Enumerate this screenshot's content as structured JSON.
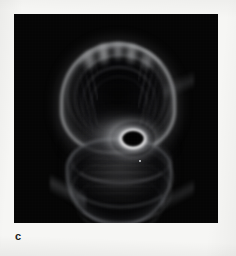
{
  "figure": {
    "panel_label": "c",
    "label_position": "bottom-left",
    "background_color": "#f6f6f4",
    "plate_color": "#050505",
    "plate": {
      "x": 14,
      "y": 14,
      "width": 204,
      "height": 209
    }
  },
  "image_content": {
    "subject": "bipolar hourglass planetary nebula",
    "description": "Two opposing nested conical lobes joined at a bright central ring; the upper lobe is brighter and wider with concentric arcs and a crenellated cap, the lower lobe is fainter with horizontal banded rings.",
    "features": [
      {
        "name": "upper-lobe",
        "label": "upper lobe",
        "center_x": 104,
        "center_y": 84,
        "brightness": "bright"
      },
      {
        "name": "upper-cap",
        "label": "crenellated cap",
        "center_x": 104,
        "center_y": 42,
        "brightness": "bright"
      },
      {
        "name": "central-ring",
        "label": "central bright ring",
        "center_x": 119,
        "center_y": 125,
        "brightness": "brightest"
      },
      {
        "name": "central-core",
        "label": "dark central cavity",
        "center_x": 119,
        "center_y": 125,
        "brightness": "dark"
      },
      {
        "name": "lower-lobe",
        "label": "lower lobe",
        "center_x": 105,
        "center_y": 168,
        "brightness": "faint"
      },
      {
        "name": "field-star",
        "label": "point source",
        "center_x": 140,
        "center_y": 161,
        "brightness": "point"
      }
    ],
    "colormap": "grayscale",
    "accent_colors": {
      "peak": "#fcfcfc",
      "mid": "#969698",
      "low": "#262628",
      "sky": "#050505"
    }
  }
}
